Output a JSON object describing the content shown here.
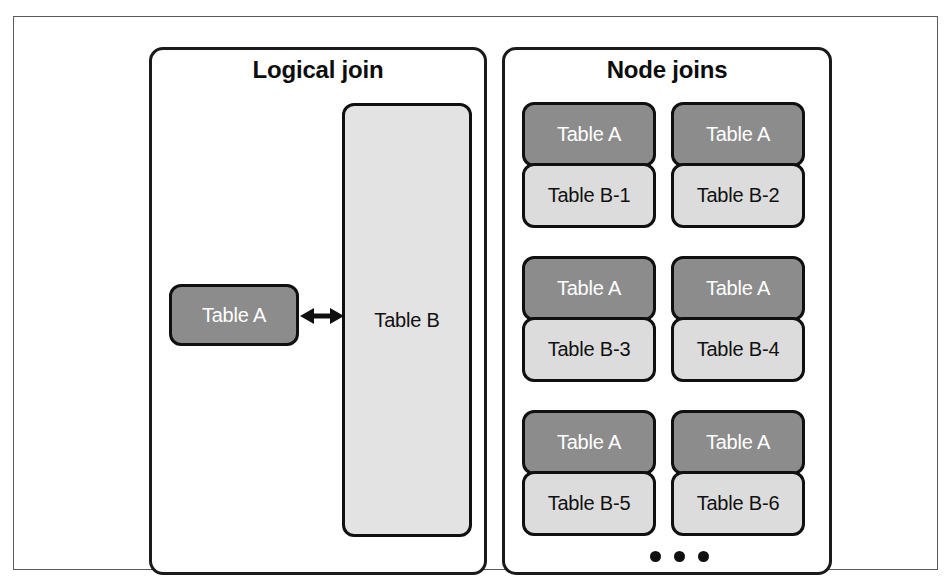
{
  "figure": {
    "width": 951,
    "height": 585,
    "background": "#ffffff",
    "frame_color": "#5b5b5b",
    "line_color": "#1a1a1a"
  },
  "colors": {
    "table_a_fill": "#8c8c8c",
    "table_a_text": "#ffffff",
    "table_b_part_fill": "#dcdcdc",
    "table_b_full_fill": "#e3e3e3",
    "text_dark": "#111111"
  },
  "panels": {
    "left": {
      "title": "Logical join",
      "table_a": {
        "label": "Table A",
        "style": "dark"
      },
      "table_b": {
        "label": "Table B",
        "style": "pale"
      },
      "connector": {
        "name": "double-headed-arrow",
        "direction": "bidirectional"
      }
    },
    "right": {
      "title": "Node joins",
      "ellipsis": "•••",
      "pairs": [
        {
          "top": {
            "label": "Table A",
            "style": "dark"
          },
          "bottom": {
            "label": "Table B-1",
            "style": "light"
          }
        },
        {
          "top": {
            "label": "Table A",
            "style": "dark"
          },
          "bottom": {
            "label": "Table B-2",
            "style": "light"
          }
        },
        {
          "top": {
            "label": "Table A",
            "style": "dark"
          },
          "bottom": {
            "label": "Table B-3",
            "style": "light"
          }
        },
        {
          "top": {
            "label": "Table A",
            "style": "dark"
          },
          "bottom": {
            "label": "Table B-4",
            "style": "light"
          }
        },
        {
          "top": {
            "label": "Table A",
            "style": "dark"
          },
          "bottom": {
            "label": "Table B-5",
            "style": "light"
          }
        },
        {
          "top": {
            "label": "Table A",
            "style": "dark"
          },
          "bottom": {
            "label": "Table B-6",
            "style": "light"
          }
        }
      ]
    }
  }
}
